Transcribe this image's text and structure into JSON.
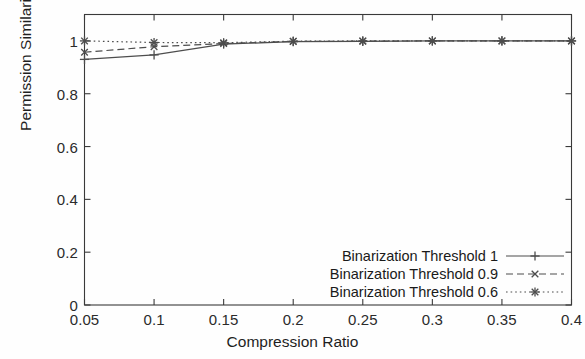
{
  "chart_data": {
    "type": "line",
    "title": "",
    "xlabel": "Compression Ratio",
    "ylabel": "Permission Similarity",
    "x": [
      0.05,
      0.1,
      0.15,
      0.2,
      0.25,
      0.3,
      0.35,
      0.4
    ],
    "xlim": [
      0.05,
      0.4
    ],
    "ylim": [
      0,
      1.1
    ],
    "xticks": [
      "0.05",
      "0.1",
      "0.15",
      "0.2",
      "0.25",
      "0.3",
      "0.35",
      "0.4"
    ],
    "yticks": [
      "0",
      "0.2",
      "0.4",
      "0.6",
      "0.8",
      "1"
    ],
    "grid": false,
    "legend_position": "lower-right",
    "series": [
      {
        "name": "Binarization Threshold 1",
        "values": [
          0.93,
          0.947,
          0.988,
          0.997,
          0.998,
          1.0,
          1.0,
          1.0
        ],
        "linestyle": "solid",
        "marker": "plus",
        "color": "#4d4d4d"
      },
      {
        "name": "Binarization Threshold 0.9",
        "values": [
          0.957,
          0.978,
          0.99,
          0.998,
          0.999,
          1.0,
          1.0,
          1.0
        ],
        "linestyle": "dashed",
        "marker": "cross",
        "color": "#4d4d4d"
      },
      {
        "name": "Binarization Threshold 0.6",
        "values": [
          1.0,
          0.994,
          0.993,
          0.999,
          1.0,
          1.0,
          1.0,
          1.0
        ],
        "linestyle": "dotted",
        "marker": "star",
        "color": "#4d4d4d"
      }
    ]
  },
  "axes": {
    "y_ticks": [
      {
        "label": "1",
        "value": 1
      },
      {
        "label": "0.8",
        "value": 0.8
      },
      {
        "label": "0.6",
        "value": 0.6
      },
      {
        "label": "0.4",
        "value": 0.4
      },
      {
        "label": "0.2",
        "value": 0.2
      },
      {
        "label": "0",
        "value": 0
      }
    ],
    "x_ticks": [
      {
        "label": "0.05",
        "value": 0.05
      },
      {
        "label": "0.1",
        "value": 0.1
      },
      {
        "label": "0.15",
        "value": 0.15
      },
      {
        "label": "0.2",
        "value": 0.2
      },
      {
        "label": "0.25",
        "value": 0.25
      },
      {
        "label": "0.3",
        "value": 0.3
      },
      {
        "label": "0.35",
        "value": 0.35
      },
      {
        "label": "0.4",
        "value": 0.4
      }
    ]
  },
  "legend": {
    "entries": [
      {
        "label": "Binarization Threshold 1"
      },
      {
        "label": "Binarization Threshold 0.9"
      },
      {
        "label": "Binarization Threshold 0.6"
      }
    ]
  },
  "style": {
    "axis_color": "#3a3a3a",
    "line_color": "#4d4d4d",
    "background": "#fefefe"
  }
}
